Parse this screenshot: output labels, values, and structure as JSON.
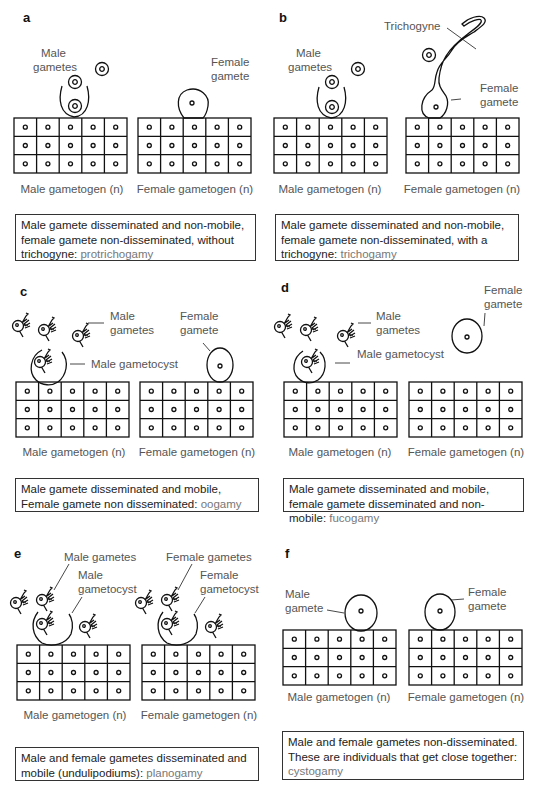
{
  "panels": [
    {
      "id": "a",
      "letter": "a",
      "labels": {
        "male_gametes": [
          "Male",
          "gametes"
        ],
        "female_gamete": [
          "Female",
          "gamete"
        ]
      },
      "tissue_labels": {
        "male": "Male gametogen (n)",
        "female": "Female gametogen (n)"
      },
      "caption": {
        "text": "Male gamete disseminated and non-mobile, female gamete non-disseminated, without trichogyne: ",
        "term": "protrichogamy"
      }
    },
    {
      "id": "b",
      "letter": "b",
      "labels": {
        "male_gametes": [
          "Male",
          "gametes"
        ],
        "female_gamete": [
          "Female",
          "gamete"
        ],
        "trichogyne": "Trichogyne"
      },
      "tissue_labels": {
        "male": "Male gametogen (n)",
        "female": "Female gametogen (n)"
      },
      "caption": {
        "text": "Male gamete disseminated and non-mobile, female gamete non-disseminated, with a trichogyne: ",
        "term": "trichogamy"
      }
    },
    {
      "id": "c",
      "letter": "c",
      "labels": {
        "male_gametes": [
          "Male",
          "gametes"
        ],
        "female_gamete": [
          "Female",
          "gamete"
        ],
        "male_gametocyst": "Male gametocyst"
      },
      "tissue_labels": {
        "male": "Male gametogen (n)",
        "female": "Female gametogen (n)"
      },
      "caption": {
        "text": "Male gamete disseminated and mobile, Female gamete non disseminated: ",
        "term": "oogamy"
      }
    },
    {
      "id": "d",
      "letter": "d",
      "labels": {
        "male_gametes": [
          "Male",
          "gametes"
        ],
        "female_gamete": [
          "Female",
          "gamete"
        ],
        "male_gametocyst": "Male gametocyst"
      },
      "tissue_labels": {
        "male": "Male gametogen (n)",
        "female": "Female gametogen (n)"
      },
      "caption": {
        "text": "Male gamete disseminated and mobile, female gamete disseminated and non-mobile: ",
        "term": "fucogamy"
      }
    },
    {
      "id": "e",
      "letter": "e",
      "labels": {
        "male_gametes": "Male gametes",
        "male_gametocyst": [
          "Male",
          "gametocyst"
        ],
        "female_gametes": "Female gametes",
        "female_gametocyst": [
          "Female",
          "gametocyst"
        ]
      },
      "tissue_labels": {
        "male": "Male gametogen (n)",
        "female": "Female gametogen (n)"
      },
      "caption": {
        "text": "Male and female gametes disseminated and mobile (undulipodiums): ",
        "term": "planogamy"
      }
    },
    {
      "id": "f",
      "letter": "f",
      "labels": {
        "male_gamete": [
          "Male",
          "gamete"
        ],
        "female_gamete": [
          "Female",
          "gamete"
        ]
      },
      "tissue_labels": {
        "male": "Male gametogen (n)",
        "female": "Female gametogen (n)"
      },
      "caption": {
        "text": "Male and female gametes non-disseminated. These are individuals that get close together: ",
        "term": "cystogamy"
      }
    }
  ],
  "grid": {
    "rows": 3,
    "cols": 5
  },
  "colors": {
    "line": "#111111",
    "label": "#555555",
    "term": "#777777"
  }
}
